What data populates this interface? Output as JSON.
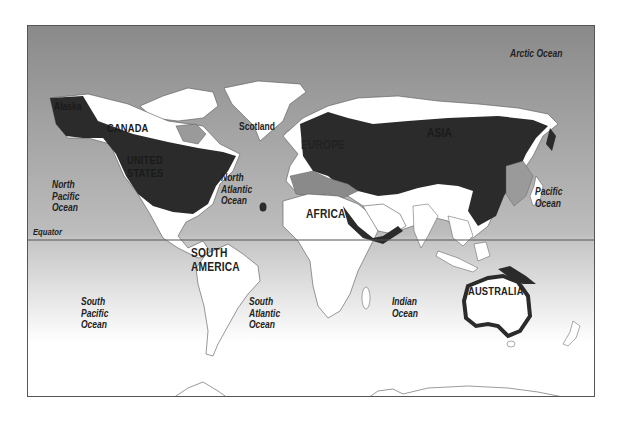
{
  "map": {
    "colors": {
      "ocean_north": "#8f8f8f",
      "ocean_equator": "#b8b8b8",
      "ocean_south": "#ffffff",
      "land": "#ffffff",
      "land_outline": "#555555",
      "range_dark": "#2b2b2b",
      "range_mid": "#6e6e6e",
      "frame": "#555555",
      "equator_line": "#555555"
    },
    "equator_label": "Equator",
    "oceans": {
      "arctic": "Arctic Ocean",
      "north_pacific": "North\nPacific\nOcean",
      "north_atlantic": "North\nAtlantic\nOcean",
      "pacific": "Pacific\nOcean",
      "south_pacific": "South\nPacific\nOcean",
      "south_atlantic": "South\nAtlantic\nOcean",
      "indian": "Indian\nOcean"
    },
    "regions": {
      "alaska": "Alaska",
      "canada": "CANADA",
      "united_states": "UNITED\nSTATES",
      "scotland": "Scotland",
      "europe": "EUROPE",
      "asia": "ASIA",
      "africa": "AFRICA",
      "south_america": "SOUTH\nAMERICA",
      "australia": "AUSTRALIA"
    }
  }
}
